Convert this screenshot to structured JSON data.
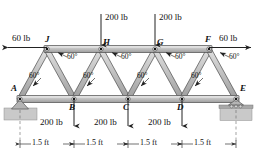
{
  "figure": {
    "type": "statics-truss-free-body-diagram",
    "colors": {
      "member_fill": "#b9b9b9",
      "member_stroke": "#3a3a3a",
      "ground_hatch": "#c8c8c8",
      "text": "#111111",
      "arrow": "#222222",
      "pin_dot": "#000000"
    }
  },
  "joints": [
    {
      "id": "A",
      "label": "A",
      "x": 20,
      "y": 99,
      "chord": "bottom",
      "support": "pin"
    },
    {
      "id": "B",
      "label": "B",
      "x": 74,
      "y": 99,
      "chord": "bottom",
      "support": "none"
    },
    {
      "id": "C",
      "label": "C",
      "x": 128,
      "y": 99,
      "chord": "bottom",
      "support": "none"
    },
    {
      "id": "D",
      "label": "D",
      "x": 182,
      "y": 99,
      "chord": "bottom",
      "support": "none"
    },
    {
      "id": "E",
      "label": "E",
      "x": 236,
      "y": 99,
      "chord": "bottom",
      "support": "roller"
    },
    {
      "id": "J",
      "label": "J",
      "x": 47,
      "y": 49,
      "chord": "top",
      "support": "none"
    },
    {
      "id": "H",
      "label": "H",
      "x": 101,
      "y": 49,
      "chord": "top",
      "support": "none"
    },
    {
      "id": "G",
      "label": "G",
      "x": 155,
      "y": 49,
      "chord": "top",
      "support": "none"
    },
    {
      "id": "F",
      "label": "F",
      "x": 209,
      "y": 49,
      "chord": "top",
      "support": "none"
    }
  ],
  "members": [
    {
      "from": "A",
      "to": "B",
      "kind": "bottom-chord"
    },
    {
      "from": "B",
      "to": "C",
      "kind": "bottom-chord"
    },
    {
      "from": "C",
      "to": "D",
      "kind": "bottom-chord"
    },
    {
      "from": "D",
      "to": "E",
      "kind": "bottom-chord"
    },
    {
      "from": "J",
      "to": "H",
      "kind": "top-chord"
    },
    {
      "from": "H",
      "to": "G",
      "kind": "top-chord"
    },
    {
      "from": "G",
      "to": "F",
      "kind": "top-chord"
    },
    {
      "from": "A",
      "to": "J",
      "kind": "diagonal"
    },
    {
      "from": "J",
      "to": "B",
      "kind": "diagonal"
    },
    {
      "from": "B",
      "to": "H",
      "kind": "diagonal"
    },
    {
      "from": "H",
      "to": "C",
      "kind": "diagonal"
    },
    {
      "from": "C",
      "to": "G",
      "kind": "diagonal"
    },
    {
      "from": "G",
      "to": "D",
      "kind": "diagonal"
    },
    {
      "from": "D",
      "to": "F",
      "kind": "diagonal"
    },
    {
      "from": "F",
      "to": "E",
      "kind": "diagonal"
    }
  ],
  "loads": [
    {
      "id": "load-J-horizontal",
      "magnitude": "60 lb",
      "at_joint": "J",
      "direction": "left",
      "label_x": 12,
      "label_y": 35
    },
    {
      "id": "load-F-horizontal",
      "magnitude": "60 lb",
      "at_joint": "F",
      "direction": "right",
      "label_x": 221,
      "label_y": 35
    },
    {
      "id": "load-H-vertical",
      "magnitude": "200 lb",
      "at_joint": "H",
      "direction": "down",
      "label_x": 104,
      "label_y": 11
    },
    {
      "id": "load-G-vertical",
      "magnitude": "200 lb",
      "at_joint": "G",
      "direction": "down",
      "label_x": 158,
      "label_y": 11
    },
    {
      "id": "load-B-vertical",
      "magnitude": "200 lb",
      "at_joint": "B",
      "direction": "down",
      "label_x": 42,
      "label_y": 120
    },
    {
      "id": "load-C-vertical",
      "magnitude": "200 lb",
      "at_joint": "C",
      "direction": "down",
      "label_x": 96,
      "label_y": 120
    },
    {
      "id": "load-D-vertical",
      "magnitude": "200 lb",
      "at_joint": "D",
      "direction": "down",
      "label_x": 150,
      "label_y": 120
    }
  ],
  "angles": [
    {
      "id": "angle-upper-1",
      "text": "60°",
      "x": 66,
      "y": 57
    },
    {
      "id": "angle-upper-2",
      "text": "60°",
      "x": 120,
      "y": 57
    },
    {
      "id": "angle-upper-3",
      "text": "60°",
      "x": 174,
      "y": 57
    },
    {
      "id": "angle-upper-4",
      "text": "60°",
      "x": 228,
      "y": 57
    },
    {
      "id": "angle-lower-1",
      "text": "60°",
      "x": 40,
      "y": 76
    },
    {
      "id": "angle-lower-2",
      "text": "60°",
      "x": 94,
      "y": 76
    },
    {
      "id": "angle-lower-3",
      "text": "60°",
      "x": 148,
      "y": 76
    },
    {
      "id": "angle-lower-4",
      "text": "60°",
      "x": 202,
      "y": 76
    }
  ],
  "dimensions": {
    "unit_line_y": 144,
    "segments": [
      {
        "id": "dim-A-B",
        "text": "1.5 ft",
        "from_x": 20,
        "to_x": 74,
        "label_x": 32
      },
      {
        "id": "dim-B-C",
        "text": "1.5 ft",
        "from_x": 74,
        "to_x": 128,
        "label_x": 86
      },
      {
        "id": "dim-C-D",
        "text": "1.5 ft",
        "from_x": 128,
        "to_x": 182,
        "label_x": 140
      },
      {
        "id": "dim-D-E",
        "text": "1.5 ft",
        "from_x": 182,
        "to_x": 236,
        "label_x": 194
      }
    ]
  },
  "supports": [
    {
      "id": "support-A",
      "type": "pin",
      "at_joint": "A",
      "x": 20,
      "y": 99
    },
    {
      "id": "support-E",
      "type": "roller",
      "at_joint": "E",
      "x": 236,
      "y": 99
    }
  ]
}
